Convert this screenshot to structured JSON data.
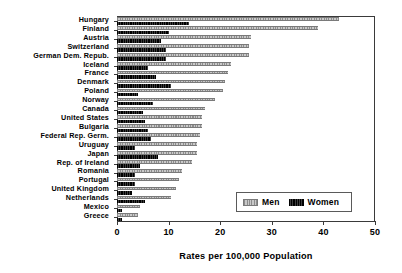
{
  "chart_data": {
    "type": "bar",
    "orientation": "horizontal",
    "title": "",
    "subtitle": "",
    "xlabel": "Rates per 100,000 Population",
    "ylabel": "",
    "xlim": [
      0,
      50
    ],
    "xticks": [
      0,
      10,
      20,
      30,
      40,
      50
    ],
    "xtick_labels": [
      "0",
      "10",
      "20",
      "30",
      "40",
      "50"
    ],
    "grid": false,
    "legend_position": "bottom-right",
    "categories": [
      "Hungary",
      "Finland",
      "Austria",
      "Switzerland",
      "German Dem. Repub.",
      "Iceland",
      "France",
      "Denmark",
      "Poland",
      "Norway",
      "Canada",
      "United States",
      "Bulgaria",
      "Federal Rep. Germ.",
      "Uruguay",
      "Japan",
      "Rep. of Ireland",
      "Romania",
      "Portugal",
      "United Kingdom",
      "Netherlands",
      "Mexico",
      "Greece"
    ],
    "series": [
      {
        "name": "Men",
        "color": "#b3b3b3",
        "values": [
          43.0,
          39.0,
          26.0,
          25.5,
          25.5,
          22.0,
          21.5,
          21.0,
          20.5,
          19.0,
          17.0,
          16.5,
          16.5,
          16.0,
          15.5,
          15.5,
          14.5,
          12.5,
          12.0,
          11.5,
          10.5,
          4.5,
          4.0
        ]
      },
      {
        "name": "Women",
        "color": "#111111",
        "values": [
          14.0,
          10.0,
          8.5,
          9.5,
          9.5,
          6.0,
          7.5,
          10.5,
          4.0,
          7.0,
          5.0,
          5.5,
          6.0,
          6.5,
          3.5,
          8.0,
          4.5,
          3.5,
          3.5,
          3.0,
          5.5,
          1.0,
          1.0
        ]
      }
    ],
    "legend": [
      {
        "label": "Men",
        "swatch": "men-swatch"
      },
      {
        "label": "Women",
        "swatch": "women-swatch"
      }
    ]
  }
}
